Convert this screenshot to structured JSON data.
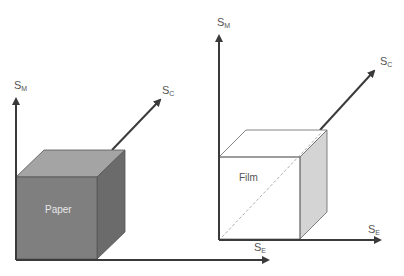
{
  "diagrams": [
    {
      "name": "paper",
      "box_label": "Paper",
      "axes": {
        "vertical": {
          "symbol": "S",
          "sub": "M"
        },
        "depth": {
          "symbol": "S",
          "sub": "C"
        },
        "horizontal": {
          "symbol": "S",
          "sub": "E"
        }
      },
      "colors": {
        "front": "#7f7f7f",
        "top": "#a4a4a4",
        "side": "#6b6b6b",
        "label": "#e8e8e8"
      }
    },
    {
      "name": "film",
      "box_label": "Film",
      "axes": {
        "vertical": {
          "symbol": "S",
          "sub": "M"
        },
        "depth": {
          "symbol": "S",
          "sub": "C"
        },
        "horizontal": {
          "symbol": "S",
          "sub": "E"
        }
      },
      "colors": {
        "front": "#ffffff",
        "top": "#ffffff",
        "side": "#d4d4d4",
        "label": "#555555"
      }
    }
  ],
  "axis_color": "#3a3a3a"
}
